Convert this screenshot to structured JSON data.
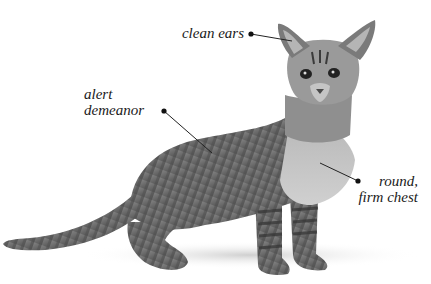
{
  "figure": {
    "background_color": "#ffffff",
    "callouts": [
      {
        "id": "ears",
        "text_lines": [
          "clean ears"
        ],
        "dot": [
          251,
          34
        ],
        "target": [
          292,
          41
        ]
      },
      {
        "id": "demeanor",
        "text_lines": [
          "alert",
          "demeanor"
        ],
        "dot": [
          164,
          111
        ],
        "target": [
          212,
          153
        ]
      },
      {
        "id": "chest",
        "text_lines": [
          "round,",
          "firm chest"
        ],
        "dot": [
          358,
          181
        ],
        "target": [
          320,
          163
        ]
      }
    ]
  },
  "labels": {
    "ears": "clean ears",
    "demeanor_1": "alert",
    "demeanor_2": "demeanor",
    "chest_1": "round,",
    "chest_2": "firm chest"
  }
}
